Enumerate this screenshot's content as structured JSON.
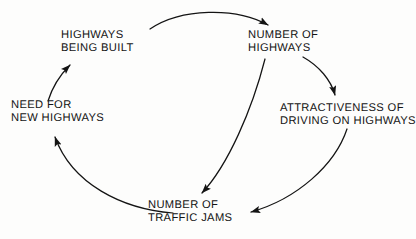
{
  "diagram": {
    "background_color": "#fdfdfc",
    "ink_color": "#141414",
    "nodes": [
      {
        "id": "highways_being_built",
        "line1": "HIGHWAYS",
        "line2": "BEING BUILT"
      },
      {
        "id": "number_of_highways",
        "line1": "NUMBER OF",
        "line2": "HIGHWAYS"
      },
      {
        "id": "need_for_new_highways",
        "line1": "NEED FOR",
        "line2": "NEW HIGHWAYS"
      },
      {
        "id": "attractiveness_of_driving",
        "line1": "ATTRACTIVENESS OF",
        "line2": "DRIVING ON HIGHWAYS"
      },
      {
        "id": "number_of_traffic_jams",
        "line1": "NUMBER OF",
        "line2": "TRAFFIC JAMS"
      }
    ],
    "edges": [
      {
        "id": "edge-built-to-number",
        "from": "highways_being_built",
        "to": "number_of_highways"
      },
      {
        "id": "edge-number-to-attractiveness",
        "from": "number_of_highways",
        "to": "attractiveness_of_driving"
      },
      {
        "id": "edge-number-to-jams",
        "from": "number_of_highways",
        "to": "number_of_traffic_jams"
      },
      {
        "id": "edge-attractiveness-to-jams",
        "from": "attractiveness_of_driving",
        "to": "number_of_traffic_jams"
      },
      {
        "id": "edge-jams-to-need",
        "from": "number_of_traffic_jams",
        "to": "need_for_new_highways"
      },
      {
        "id": "edge-need-to-built",
        "from": "need_for_new_highways",
        "to": "highways_being_built"
      }
    ]
  }
}
